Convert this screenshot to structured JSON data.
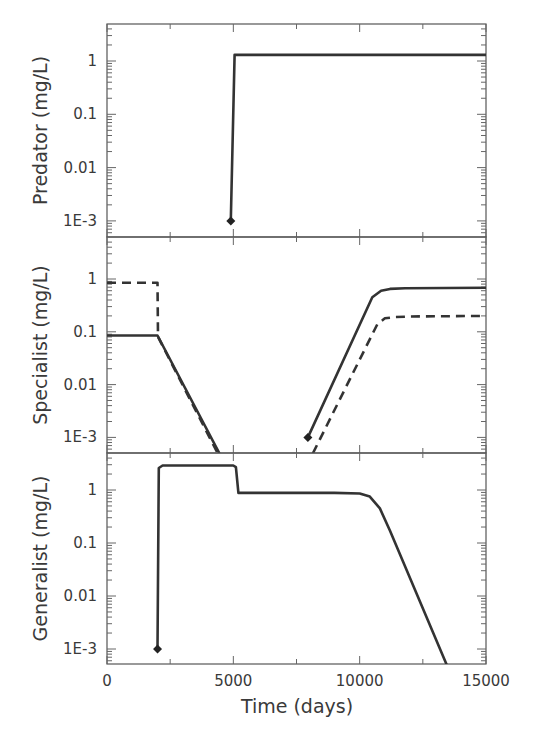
{
  "chart_data": [
    {
      "type": "line",
      "panel": "predator",
      "ylabel": "Predator (mg/L)",
      "yscale": "log",
      "ylim": [
        0.0005,
        5
      ],
      "yticks": [
        1,
        0.1,
        0.01,
        0.001
      ],
      "ytick_labels": [
        "1",
        "0.1",
        "0.01",
        "1E-3"
      ],
      "xlim": [
        0,
        15000
      ],
      "series": [
        {
          "name": "Predator",
          "style": "solid",
          "x": [
            4900,
            5050,
            15000
          ],
          "y": [
            0.001,
            1.3,
            1.3
          ]
        }
      ],
      "markers": [
        {
          "x": 4900,
          "y": 0.001,
          "shape": "diamond"
        }
      ]
    },
    {
      "type": "line",
      "panel": "specialist",
      "ylabel": "Specialist (mg/L)",
      "yscale": "log",
      "ylim": [
        0.0005,
        5
      ],
      "yticks": [
        1,
        0.1,
        0.01,
        0.001
      ],
      "ytick_labels": [
        "1",
        "0.1",
        "0.01",
        "1E-3"
      ],
      "xlim": [
        0,
        15000
      ],
      "series": [
        {
          "name": "Specialist (solid)",
          "style": "solid",
          "x": [
            0,
            2000,
            4450,
            null,
            7950,
            10500,
            10850,
            11200,
            11800,
            15000
          ],
          "y": [
            0.085,
            0.085,
            0.0005,
            null,
            0.001,
            0.45,
            0.6,
            0.65,
            0.67,
            0.68
          ]
        },
        {
          "name": "Specialist (dashed)",
          "style": "dashed",
          "x": [
            0,
            2000,
            2020,
            4380,
            null,
            8150,
            10700,
            11000,
            11400,
            12000,
            15000
          ],
          "y": [
            0.85,
            0.85,
            0.08,
            0.0005,
            null,
            0.0005,
            0.14,
            0.18,
            0.19,
            0.195,
            0.2
          ]
        }
      ],
      "markers": [
        {
          "x": 7950,
          "y": 0.001,
          "shape": "diamond"
        }
      ]
    },
    {
      "type": "line",
      "panel": "generalist",
      "ylabel": "Generalist (mg/L)",
      "xlabel": "Time (days)",
      "yscale": "log",
      "ylim": [
        0.0005,
        5
      ],
      "yticks": [
        1,
        0.1,
        0.01,
        0.001
      ],
      "ytick_labels": [
        "1",
        "0.1",
        "0.01",
        "1E-3"
      ],
      "xlim": [
        0,
        15000
      ],
      "xticks": [
        0,
        5000,
        10000,
        15000
      ],
      "xtick_labels": [
        "0",
        "5000",
        "10000",
        "15000"
      ],
      "series": [
        {
          "name": "Generalist",
          "style": "solid",
          "x": [
            2000,
            2050,
            2200,
            5000,
            5100,
            5200,
            9000,
            10000,
            10400,
            10800,
            11200,
            13450
          ],
          "y": [
            0.001,
            2.6,
            2.9,
            2.9,
            2.7,
            0.88,
            0.88,
            0.86,
            0.75,
            0.45,
            0.17,
            0.0005
          ]
        }
      ],
      "markers": [
        {
          "x": 2000,
          "y": 0.001,
          "shape": "diamond"
        }
      ]
    }
  ]
}
